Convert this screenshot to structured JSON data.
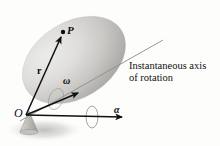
{
  "figure": {
    "background_color": "#fdfdfc"
  },
  "labels": {
    "point_p": "P",
    "position_vector": "r",
    "angular_velocity": "ω",
    "angular_acceleration": "α",
    "origin": "O",
    "axis_line1": "Instantaneous axis",
    "axis_line2": "of rotation"
  },
  "colors": {
    "body_light": "#e4e4e2",
    "body_mid": "#c9c9c7",
    "body_dark": "#a9a9a6",
    "vector": "#101010",
    "axis_line": "#8c8c8c",
    "shadow": "#bdbdba",
    "text": "#0d0d0d"
  },
  "geometry": {
    "ellipsoid": {
      "center_x": 74,
      "center_y": 60,
      "radius_x": 56,
      "radius_y": 38,
      "rotation_deg": -32
    },
    "origin_point": {
      "x": 26,
      "y": 115
    },
    "point_p": {
      "x": 62,
      "y": 33
    },
    "omega_arrow_tip": {
      "x": 78,
      "y": 93
    },
    "alpha_arrow_tip": {
      "x": 122,
      "y": 117
    },
    "axis_line_end": {
      "x": 163,
      "y": 40
    }
  }
}
